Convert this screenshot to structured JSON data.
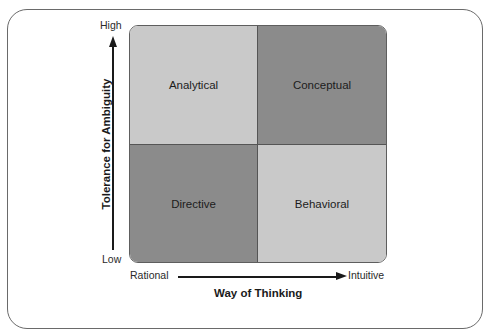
{
  "diagram": {
    "type": "2x2 matrix",
    "y_axis": {
      "title": "Tolerance for Ambiguity",
      "high_label": "High",
      "low_label": "Low"
    },
    "x_axis": {
      "title": "Way of Thinking",
      "left_label": "Rational",
      "right_label": "Intuitive"
    },
    "quadrants": [
      {
        "position": "top-left",
        "label": "Analytical",
        "shade": "light",
        "color": "#c8c8c8"
      },
      {
        "position": "top-right",
        "label": "Conceptual",
        "shade": "dark",
        "color": "#8c8c8c"
      },
      {
        "position": "bottom-left",
        "label": "Directive",
        "shade": "dark",
        "color": "#8c8c8c"
      },
      {
        "position": "bottom-right",
        "label": "Behavioral",
        "shade": "light",
        "color": "#c8c8c8"
      }
    ]
  }
}
